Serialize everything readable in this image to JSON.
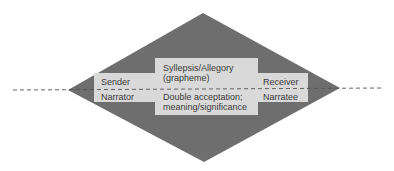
{
  "diagram": {
    "colors": {
      "background": "#ffffff",
      "diamond_fill": "#6e6e6e",
      "box_fill": "#d9d9d9",
      "text": "#3a3a3a",
      "dash_line": "#555555"
    },
    "left_box": {
      "upper_label": "Sender",
      "lower_label": "Narrator"
    },
    "center_box": {
      "upper_line1": "Syllepsis/Allegory",
      "upper_line2": "(grapheme)",
      "lower_line1": "Double acceptation;",
      "lower_line2": "meaning/significance"
    },
    "right_box": {
      "upper_label": "Receiver",
      "lower_label": "Narratee"
    }
  }
}
